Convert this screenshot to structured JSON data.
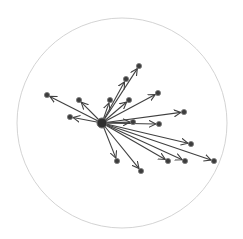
{
  "diagram": {
    "type": "radial-network",
    "boundary": {
      "cx": 122,
      "cy": 123,
      "r": 105,
      "color": "#c8c8c8"
    },
    "hub": {
      "id": "hub",
      "x": 102,
      "y": 123,
      "r": 5
    },
    "edge_color": "#404040",
    "node_color": "#3d3d3d",
    "nodes": [
      {
        "id": "n1",
        "x": 47,
        "y": 95
      },
      {
        "id": "n2",
        "x": 79,
        "y": 100
      },
      {
        "id": "n3",
        "x": 70,
        "y": 117
      },
      {
        "id": "n4",
        "x": 110,
        "y": 100
      },
      {
        "id": "n5",
        "x": 129,
        "y": 100
      },
      {
        "id": "n6",
        "x": 126,
        "y": 79
      },
      {
        "id": "n7",
        "x": 139,
        "y": 66
      },
      {
        "id": "n8",
        "x": 158,
        "y": 93
      },
      {
        "id": "n9",
        "x": 184,
        "y": 112
      },
      {
        "id": "n10",
        "x": 133,
        "y": 122
      },
      {
        "id": "n11",
        "x": 159,
        "y": 124
      },
      {
        "id": "n12",
        "x": 191,
        "y": 144
      },
      {
        "id": "n13",
        "x": 168,
        "y": 161
      },
      {
        "id": "n14",
        "x": 185,
        "y": 161
      },
      {
        "id": "n15",
        "x": 214,
        "y": 161
      },
      {
        "id": "n16",
        "x": 117,
        "y": 161
      },
      {
        "id": "n17",
        "x": 141,
        "y": 171
      }
    ],
    "edges": [
      {
        "from": "hub",
        "to": "n1"
      },
      {
        "from": "hub",
        "to": "n2"
      },
      {
        "from": "hub",
        "to": "n3"
      },
      {
        "from": "hub",
        "to": "n4"
      },
      {
        "from": "hub",
        "to": "n5"
      },
      {
        "from": "hub",
        "to": "n6"
      },
      {
        "from": "hub",
        "to": "n7"
      },
      {
        "from": "hub",
        "to": "n8"
      },
      {
        "from": "hub",
        "to": "n9"
      },
      {
        "from": "hub",
        "to": "n10"
      },
      {
        "from": "hub",
        "to": "n11"
      },
      {
        "from": "hub",
        "to": "n12"
      },
      {
        "from": "hub",
        "to": "n13"
      },
      {
        "from": "hub",
        "to": "n14"
      },
      {
        "from": "hub",
        "to": "n15"
      },
      {
        "from": "hub",
        "to": "n16"
      },
      {
        "from": "hub",
        "to": "n17"
      }
    ]
  }
}
